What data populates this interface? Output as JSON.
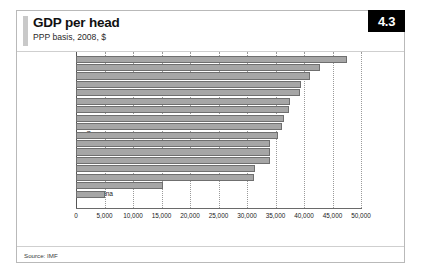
{
  "header": {
    "title": "GDP per head",
    "subtitle": "PPP basis, 2008, $",
    "badge": "4.3"
  },
  "footer": {
    "source": "Source: IMF"
  },
  "chart_data": {
    "type": "bar",
    "orientation": "horizontal",
    "title": "GDP per head",
    "subtitle": "PPP basis, 2008, $",
    "xlabel": "",
    "ylabel": "",
    "xlim": [
      0,
      50000
    ],
    "xticks": [
      0,
      5000,
      10000,
      15000,
      20000,
      25000,
      30000,
      35000,
      40000,
      45000,
      50000
    ],
    "xticklabels": [
      "0",
      "5,000",
      "10,000",
      "15,000",
      "20,000",
      "25,000",
      "30,000",
      "35,000",
      "40,000",
      "45,000",
      "50,000"
    ],
    "grid": "vertical-dotted",
    "legend": "none",
    "bar_color": "#a6a6a6",
    "bar_edge_color": "#6f6f6f",
    "categories": [
      "US",
      "Switzerland",
      "Netherlands",
      "Canada",
      "Austria",
      "Sweden",
      "Australia",
      "UK",
      "Belgium",
      "Germany",
      "Euro area",
      "Japan",
      "France",
      "Italy",
      "Spain",
      "Russia",
      "China"
    ],
    "values": [
      47500,
      42800,
      41000,
      39400,
      39300,
      37500,
      37300,
      36500,
      36200,
      35500,
      34100,
      34000,
      34000,
      31400,
      31300,
      15200,
      5000
    ]
  }
}
